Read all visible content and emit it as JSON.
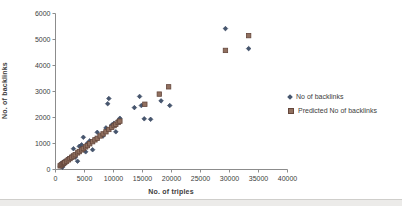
{
  "chart": {
    "x_axis_title": "No. of triples",
    "y_axis_title": "No. of backlinks",
    "colors": {
      "actual_fill": "#46566e",
      "actual_stroke": "#32405a",
      "predicted_fill": "#91705f",
      "predicted_stroke": "#64473c",
      "axis_line": "#8c8c8c",
      "tick_text": "#3d3d3d"
    },
    "legend": [
      {
        "label": "No of backlinks",
        "marker": "diamond"
      },
      {
        "label": "Predicted No of backlinks",
        "marker": "square"
      }
    ]
  },
  "chart_data": {
    "type": "scatter",
    "title": "",
    "xlabel": "No. of triples",
    "ylabel": "No. of backlinks",
    "xlim": [
      0,
      40000
    ],
    "ylim": [
      0,
      6000
    ],
    "x_ticks": [
      0,
      5000,
      10000,
      15000,
      20000,
      25000,
      30000,
      35000,
      40000
    ],
    "y_ticks": [
      0,
      1000,
      2000,
      3000,
      4000,
      5000,
      6000
    ],
    "grid": false,
    "legend_position": "right",
    "series": [
      {
        "name": "No of backlinks",
        "marker": "diamond",
        "points": [
          [
            800,
            130
          ],
          [
            1000,
            240
          ],
          [
            1200,
            90
          ],
          [
            1400,
            300
          ],
          [
            1600,
            210
          ],
          [
            1900,
            350
          ],
          [
            2200,
            430
          ],
          [
            2500,
            380
          ],
          [
            2800,
            520
          ],
          [
            3100,
            800
          ],
          [
            3400,
            470
          ],
          [
            3800,
            320
          ],
          [
            4100,
            890
          ],
          [
            4500,
            950
          ],
          [
            4800,
            1240
          ],
          [
            5200,
            680
          ],
          [
            5500,
            1010
          ],
          [
            5900,
            1100
          ],
          [
            6400,
            760
          ],
          [
            6800,
            1160
          ],
          [
            7200,
            1430
          ],
          [
            7700,
            1300
          ],
          [
            8200,
            1290
          ],
          [
            8700,
            1600
          ],
          [
            9000,
            2530
          ],
          [
            9200,
            2730
          ],
          [
            9700,
            1710
          ],
          [
            10100,
            1780
          ],
          [
            10400,
            1450
          ],
          [
            10800,
            1880
          ],
          [
            11100,
            1970
          ],
          [
            13600,
            2380
          ],
          [
            14500,
            2810
          ],
          [
            14800,
            2460
          ],
          [
            15300,
            1950
          ],
          [
            16400,
            1930
          ],
          [
            18200,
            2640
          ],
          [
            19700,
            2460
          ],
          [
            29300,
            5420
          ],
          [
            33300,
            4650
          ]
        ]
      },
      {
        "name": "Predicted No of backlinks",
        "marker": "square",
        "points": [
          [
            800,
            140
          ],
          [
            1000,
            175
          ],
          [
            1200,
            205
          ],
          [
            1400,
            240
          ],
          [
            1600,
            270
          ],
          [
            1900,
            320
          ],
          [
            2200,
            370
          ],
          [
            2500,
            420
          ],
          [
            2800,
            470
          ],
          [
            3100,
            520
          ],
          [
            3400,
            570
          ],
          [
            3800,
            640
          ],
          [
            4100,
            690
          ],
          [
            4500,
            755
          ],
          [
            4800,
            805
          ],
          [
            5200,
            870
          ],
          [
            5500,
            920
          ],
          [
            5900,
            990
          ],
          [
            6400,
            1070
          ],
          [
            6800,
            1140
          ],
          [
            7200,
            1200
          ],
          [
            7700,
            1290
          ],
          [
            8200,
            1370
          ],
          [
            8700,
            1450
          ],
          [
            9200,
            1540
          ],
          [
            9700,
            1620
          ],
          [
            10100,
            1690
          ],
          [
            10400,
            1740
          ],
          [
            10800,
            1810
          ],
          [
            11100,
            1860
          ],
          [
            15400,
            2510
          ],
          [
            17900,
            2900
          ],
          [
            19500,
            3180
          ],
          [
            29300,
            4580
          ],
          [
            33300,
            5150
          ]
        ]
      }
    ]
  }
}
